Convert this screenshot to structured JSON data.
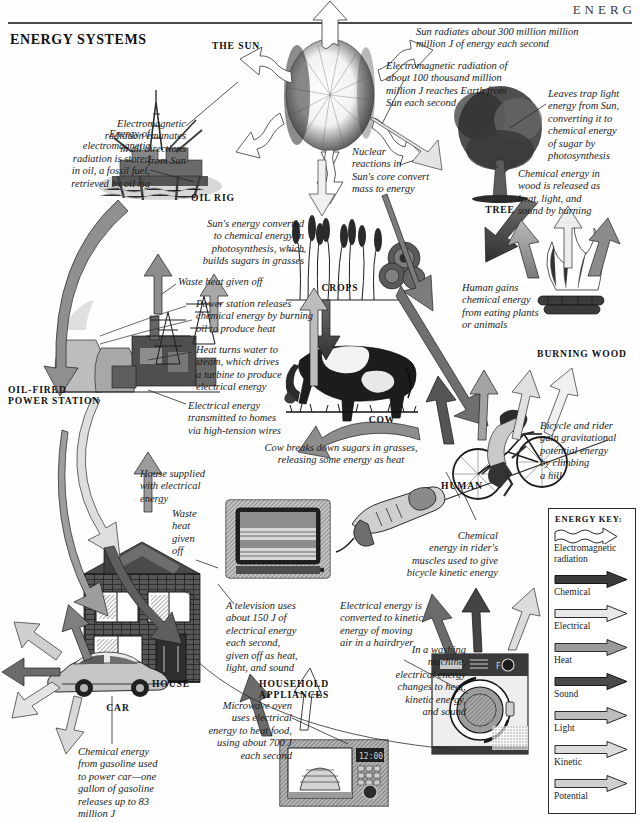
{
  "header": {
    "running_head": "ENERG",
    "title": "ENERGY SYSTEMS"
  },
  "labels": {
    "the_sun": "THE SUN",
    "oil_rig": "OIL RIG",
    "tree": "TREE",
    "crops": "CROPS",
    "cow": "COW",
    "burning_wood": "BURNING WOOD",
    "human": "HUMAN",
    "power_station": "OIL-FIRED\nPOWER STATION",
    "house": "HOUSE",
    "car": "CAR",
    "household_appliances": "HOUSEHOLD APPLIANCES"
  },
  "captions": {
    "sun_radiates": "Sun radiates about 300 million million\nmillion J of energy each second",
    "em_reaches_earth": "Electromagnetic radiation of\nabout 100 thousand million\nmillion J reaches Earth from\nSun each second",
    "em_emanates": "Electromagnetic\nradiation emanates\nin all directions\nfrom Sun",
    "nuclear_reactions": "Nuclear\nreactions in\nSun's core convert\nmass to energy",
    "leaves_trap": "Leaves trap light\nenergy from Sun,\nconverting it to\nchemical energy\nof  sugar by\nphotosynthesis",
    "wood_burning": "Chemical energy in\nwood is released as\nheat, light, and\nsound by burning",
    "oil_storage": "Energy of\nelectromagnetic\nradiation is stored\nin oil, a fossil fuel,\nretrieved by oil rig",
    "photosynthesis_grasses": "Sun's energy converted\nto chemical energy in\nphotosynthesis, which\nbuilds sugars in grasses",
    "waste_heat_station": "Waste heat given off",
    "power_station_releases": "Power station releases\nchemical energy by burning\noil to produce heat",
    "heat_turns_water": "Heat turns water to\nsteam, which drives\na turbine to produce\nelectrical energy",
    "electrical_transmitted": "Electrical energy\ntransmitted to homes\nvia high-tension wires",
    "human_gains": "Human gains\nchemical energy\nfrom eating plants\nor animals",
    "cow_breaks_down": "Cow breaks down sugars in grasses,\nreleasing some energy as heat",
    "bicycle_potential": "Bicycle and rider\ngain gravitational\npotential energy\nby climbing\na hill",
    "house_supplied": "House supplied\nwith electrical\nenergy",
    "waste_heat_house": "Waste\nheat\ngiven\noff",
    "television": "A television uses\nabout 150 J of\nelectrical energy\neach second,\ngiven off  as heat,\nlight, and sound",
    "hairdryer": "Electrical energy is\nconverted to kinetic\nenergy of  moving\nair in a hairdryer",
    "riders_muscles": "Chemical\nenergy in rider's\nmuscles used to give\nbicycle kinetic energy",
    "washing_machine": "In a washing\nmachine,\nelectrical energy\nchanges to heat,\nkinetic energy,\nand sound",
    "microwave": "Microwave oven\nuses electrical\nenergy to heat food,\nusing about 700 J\neach second",
    "car_gasoline": "Chemical energy\nfrom gasoline used\nto power car—one\ngallon of  gasoline\nreleases up to 83\nmillion J"
  },
  "energy_key": {
    "title": "ENERGY KEY:",
    "items": [
      {
        "label": "Electromagnetic\nradiation",
        "style": "wavy",
        "color": "#ffffff"
      },
      {
        "label": "Chemical",
        "style": "solid",
        "color": "#3b3b3b"
      },
      {
        "label": "Electrical",
        "style": "solid",
        "color": "#e8e8e8"
      },
      {
        "label": "Heat",
        "style": "solid",
        "color": "#9a9a9a"
      },
      {
        "label": "Sound",
        "style": "solid",
        "color": "#4a4a4a"
      },
      {
        "label": "Light",
        "style": "solid",
        "color": "#bdbdbd"
      },
      {
        "label": "Kinetic",
        "style": "solid",
        "color": "#dcdcdc"
      },
      {
        "label": "Potential",
        "style": "solid",
        "color": "#cfcfcf"
      }
    ]
  }
}
